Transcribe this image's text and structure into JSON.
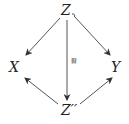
{
  "diagram": {
    "nodes": {
      "top": "Z",
      "left": "X",
      "right": "Y",
      "bottom": "Z′′"
    },
    "edges": [
      {
        "from": "Z",
        "to": "X",
        "label": ""
      },
      {
        "from": "Z",
        "to": "Y",
        "label": ""
      },
      {
        "from": "Z",
        "to": "Z′′",
        "label": "≅"
      },
      {
        "from": "Z′′",
        "to": "X",
        "label": ""
      },
      {
        "from": "Z′′",
        "to": "Y",
        "label": ""
      }
    ],
    "iso_label": "≅"
  }
}
